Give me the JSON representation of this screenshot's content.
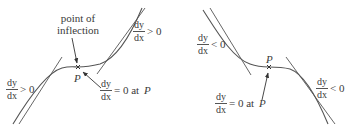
{
  "figure": {
    "left_panel": {
      "title": "rising point of inflection",
      "annotation_inflection": {
        "line1": "point of",
        "line2": "inflection"
      },
      "point_label": "P",
      "gradient_left": {
        "num": "dy",
        "den": "dx",
        "relation": "> 0"
      },
      "gradient_right": {
        "num": "dy",
        "den": "dx",
        "relation": "> 0"
      },
      "gradient_at_P": {
        "num": "dy",
        "den": "dx",
        "relation": "= 0 at",
        "point": "P"
      }
    },
    "right_panel": {
      "title": "falling point of inflection",
      "point_label": "P",
      "gradient_left": {
        "num": "dy",
        "den": "dx",
        "relation": "< 0"
      },
      "gradient_right": {
        "num": "dy",
        "den": "dx",
        "relation": "< 0"
      },
      "gradient_at_P": {
        "num": "dy",
        "den": "dx",
        "relation": "= 0 at",
        "point": "P"
      }
    },
    "colors": {
      "curve": "#555555",
      "tangent": "#555555",
      "text": "#3a3a3a",
      "background": "#ffffff"
    }
  }
}
